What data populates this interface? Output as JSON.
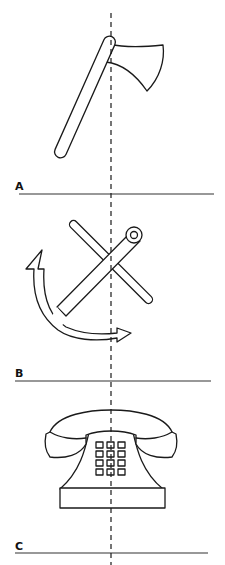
{
  "figure": {
    "colors": {
      "stroke": "#1a1a1a",
      "background": "#ffffff"
    },
    "panels": [
      {
        "id": "A",
        "label": "A",
        "object": "axe"
      },
      {
        "id": "B",
        "label": "B",
        "object": "anchor"
      },
      {
        "id": "C",
        "label": "C",
        "object": "telephone"
      }
    ],
    "axis": {
      "style": "dashed",
      "orientation": "vertical"
    }
  }
}
